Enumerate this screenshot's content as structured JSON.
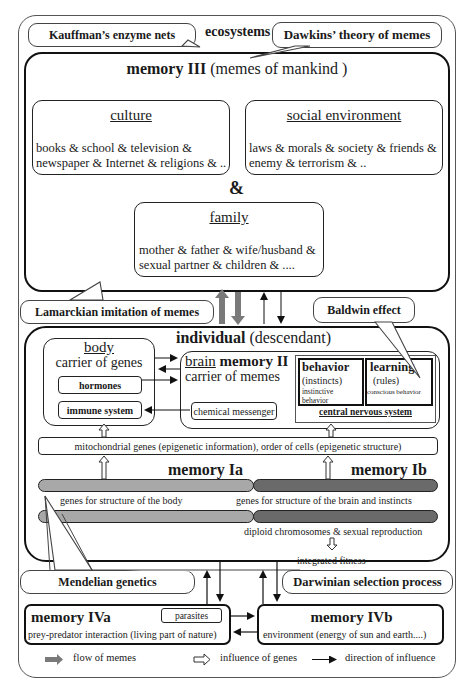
{
  "callouts": {
    "kauffman": "Kauffman’s enzyme nets",
    "dawkins": "Dawkins’ theory of memes",
    "lamarck": "Lamarckian imitation of memes",
    "baldwin": "Baldwin effect",
    "mendel": "Mendelian genetics",
    "darwin": "Darwinian selection process"
  },
  "ecosystems_label": "ecosystems",
  "memory3": {
    "title_bold": "memory III",
    "title_rest": "(memes of mankind )",
    "culture": {
      "title": "culture",
      "line1": "books & school & television &",
      "line2": "newspaper & Internet & religions & .."
    },
    "social": {
      "title": "social environment",
      "line1": "laws & morals & society & friends &",
      "line2": "enemy & terrorism & .."
    },
    "ampersand": "&",
    "family": {
      "title": "family",
      "line1": "mother & father & wife/husband &",
      "line2": "sexual partner & children & ...."
    }
  },
  "individual": {
    "title_bold": "individual",
    "title_rest": "(descendant)",
    "body": {
      "title": "body",
      "subtitle": "carrier of genes",
      "hormones": "hormones",
      "immune": "immune system"
    },
    "brain": {
      "title_u": "brain",
      "title_bold": "memory II",
      "subtitle": "carrier of memes",
      "chemical": "chemical messenger"
    },
    "cns": {
      "behavior_title": "behavior",
      "behavior_sub": "(instincts)",
      "behavior_small1": "instinctive",
      "behavior_small2": "behavior",
      "learning_title": "learning",
      "learning_sub": "(rules)",
      "learning_small": "conscious behavior",
      "label": "central nervous system"
    },
    "epigenetic": "mitochondrial genes (epigenetic information), order of cells (epigenetic structure)",
    "memory_ia": "memory Ia",
    "memory_ib": "memory Ib",
    "genes_body": "genes for  structure of the body",
    "genes_brain": "genes for  structure of the brain and instincts",
    "diploid": "diploid chromosomes & sexual reproduction",
    "fitness": "integrated fitness"
  },
  "memory4a": {
    "title": "memory IVa",
    "parasites": "parasites",
    "sub": "prey-predator interaction (living part of nature)"
  },
  "memory4b": {
    "title": "memory IVb",
    "sub": "environment (energy of sun and earth....)"
  },
  "legend": {
    "memes": "flow of  memes",
    "genes": "influence of  genes",
    "direction": "direction of influence"
  },
  "colors": {
    "meme_arrow": "#7a7a7a",
    "chrom_light": "#a8a8a8",
    "chrom_dark": "#6a6a6a"
  }
}
